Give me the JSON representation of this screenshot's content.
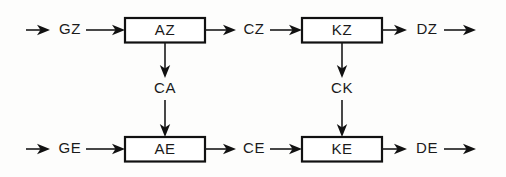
{
  "diagram": {
    "type": "block-diagram",
    "background_color": "#fdfdfc",
    "line_color": "#1a1a1a",
    "box_fill_color": "#ffffff",
    "box_stroke_color": "#111111",
    "text_color": "#1a1a1a",
    "rows": [
      {
        "row_id": "top-row",
        "input_signal": "GZ",
        "blocks": [
          {
            "id": "block-az",
            "label": "AZ"
          },
          {
            "id": "block-kz",
            "label": "KZ"
          }
        ],
        "intermediate_signal": "CZ",
        "output_signal": "DZ"
      },
      {
        "row_id": "bottom-row",
        "input_signal": "GE",
        "blocks": [
          {
            "id": "block-ae",
            "label": "AE"
          },
          {
            "id": "block-ke",
            "label": "KE"
          }
        ],
        "intermediate_signal": "CE",
        "output_signal": "DE"
      }
    ],
    "vertical_couplings": [
      {
        "id": "coupling-ca",
        "label": "CA",
        "from_block": "AZ",
        "to_block": "AE"
      },
      {
        "id": "coupling-ck",
        "label": "CK",
        "from_block": "KZ",
        "to_block": "KE"
      }
    ],
    "labels": {
      "GZ": "GZ",
      "AZ": "AZ",
      "CZ": "CZ",
      "KZ": "KZ",
      "DZ": "DZ",
      "CA": "CA",
      "CK": "CK",
      "GE": "GE",
      "AE": "AE",
      "CE": "CE",
      "KE": "KE",
      "DE": "DE"
    }
  }
}
